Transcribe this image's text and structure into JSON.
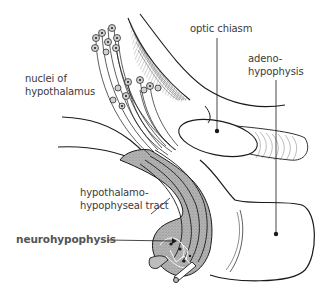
{
  "diagram": {
    "labels": {
      "nuclei": {
        "line1": "nuclei of",
        "line2": "hypothalamus"
      },
      "optic_chiasm": {
        "text": "optic chiasm"
      },
      "adenohypophysis": {
        "line1": "adeno-",
        "line2": "hypophysis"
      },
      "tract": {
        "line1": "hypothalamo-",
        "line2": "hypophyseal tract"
      },
      "neurohypophysis": {
        "text": "neurohypophysis"
      }
    },
    "colors": {
      "ink": "#1a1a1a",
      "text": "#3a3a3a",
      "bold_text": "#555555",
      "shading": "#9a9a9a",
      "background": "#ffffff"
    }
  }
}
